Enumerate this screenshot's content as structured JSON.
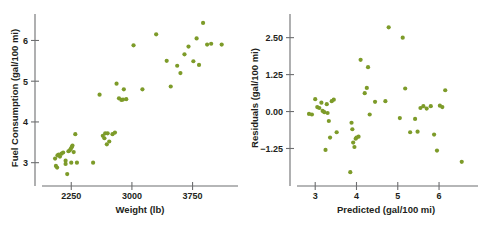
{
  "figure": {
    "background": "#ffffff",
    "marker_color": "#7d9b29",
    "axis_color": "#6d6e70",
    "text_color": "#231f20"
  },
  "chart_data": [
    {
      "type": "scatter",
      "panel": "left",
      "title": "",
      "xlabel": "Weight (lb)",
      "ylabel": "Fuel Consumption (gal/100 mi)",
      "xlim": [
        1950,
        4250
      ],
      "ylim": [
        2.55,
        6.65
      ],
      "xticks": [
        2250,
        3000,
        3750
      ],
      "xticklabels": [
        "2250",
        "3000",
        "3750"
      ],
      "yticks": [
        3,
        4,
        5,
        6
      ],
      "yticklabels": [
        "3",
        "4",
        "5",
        "6"
      ],
      "grid": false,
      "legend": "none",
      "x": [
        2050,
        2060,
        2075,
        2080,
        2095,
        2110,
        2130,
        2150,
        2180,
        2200,
        2215,
        2230,
        2245,
        2255,
        2265,
        2280,
        2300,
        2180,
        2250,
        2320,
        2520,
        2600,
        2640,
        2660,
        2670,
        2690,
        2700,
        2720,
        2760,
        2790,
        2810,
        2840,
        2870,
        2890,
        2900,
        2930,
        3020,
        3130,
        3300,
        3430,
        3480,
        3560,
        3600,
        3650,
        3700,
        3760,
        3800,
        3830,
        3880,
        3930,
        3980,
        4110
      ],
      "y": [
        3.1,
        2.92,
        2.88,
        3.18,
        3.2,
        3.15,
        3.22,
        3.25,
        2.97,
        2.72,
        3.28,
        3.3,
        3.34,
        3.38,
        3.42,
        3.26,
        3.7,
        3.05,
        3.0,
        3.0,
        3.0,
        4.67,
        3.66,
        3.6,
        3.72,
        3.45,
        3.72,
        3.52,
        3.7,
        3.74,
        4.94,
        4.58,
        4.54,
        4.55,
        4.8,
        4.56,
        5.88,
        4.8,
        6.15,
        5.5,
        4.87,
        5.38,
        5.2,
        5.66,
        5.85,
        5.49,
        6.05,
        5.4,
        6.43,
        5.9,
        5.92,
        5.9
      ]
    },
    {
      "type": "scatter",
      "panel": "right",
      "title": "",
      "xlabel": "Predicted (gal/100 mi)",
      "ylabel": "Residuals (gal/100 mi)",
      "xlim": [
        2.68,
        6.75
      ],
      "ylim": [
        -2.35,
        3.3
      ],
      "xticks": [
        3,
        4,
        5,
        6
      ],
      "xticklabels": [
        "3",
        "4",
        "5",
        "6"
      ],
      "yticks": [
        2.5,
        1.25,
        0.0,
        -1.25
      ],
      "yticklabels": [
        "2.50",
        "1.25",
        "0.00",
        "−1.25"
      ],
      "grid": false,
      "legend": "none",
      "x": [
        2.85,
        2.92,
        3.0,
        3.05,
        3.1,
        3.15,
        3.18,
        3.22,
        3.25,
        3.28,
        3.3,
        3.33,
        3.36,
        3.4,
        3.45,
        3.52,
        3.85,
        3.88,
        3.9,
        3.92,
        3.95,
        3.98,
        4.0,
        4.05,
        4.1,
        4.2,
        4.25,
        4.28,
        4.32,
        4.45,
        4.7,
        4.78,
        5.05,
        5.12,
        5.18,
        5.3,
        5.42,
        5.48,
        5.55,
        5.62,
        5.7,
        5.8,
        5.88,
        5.95,
        6.02,
        6.08,
        6.15,
        6.55
      ],
      "y": [
        -0.08,
        -0.1,
        0.42,
        0.15,
        0.12,
        0.3,
        0.02,
        -0.02,
        -1.3,
        0.25,
        -0.05,
        -0.32,
        -0.88,
        0.35,
        0.4,
        -0.7,
        -2.05,
        -0.38,
        -0.6,
        -1.05,
        -1.2,
        -0.92,
        -0.88,
        -0.85,
        1.75,
        0.62,
        0.8,
        1.5,
        -0.1,
        0.33,
        0.35,
        2.85,
        -0.22,
        2.5,
        0.78,
        -0.7,
        -0.25,
        -0.68,
        0.12,
        0.18,
        0.1,
        0.18,
        -0.78,
        -1.32,
        0.2,
        0.15,
        0.72,
        -1.7
      ]
    }
  ]
}
